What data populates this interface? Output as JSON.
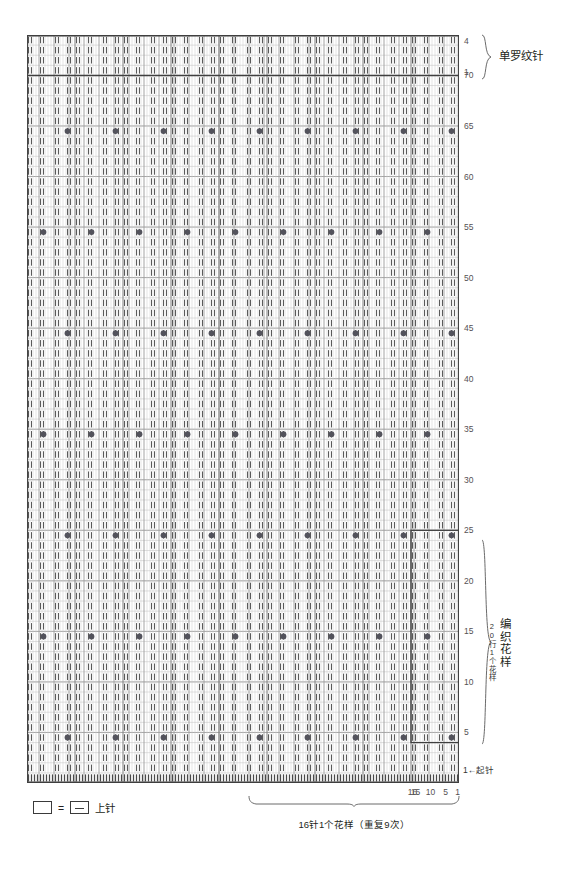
{
  "document": {
    "type": "knitting-stitch-chart",
    "width": 565,
    "height": 873,
    "background": "#ffffff",
    "ink": "#231f20"
  },
  "chart_data": {
    "type": "heatmap",
    "title": "",
    "grid": {
      "columns": 144,
      "rows": 74,
      "cell_width": 3,
      "cell_height": 10.1,
      "stitch_repeat_width": 16,
      "stitch_repeat_count": 9,
      "row_repeat_height": 20
    },
    "axis": {
      "x_label": "16针1个花样（重复9次）",
      "x_ticks": [
        {
          "value": 16,
          "label": "16"
        },
        {
          "value": 15,
          "label": "15"
        },
        {
          "value": 10,
          "label": "10"
        },
        {
          "value": 5,
          "label": "5"
        },
        {
          "value": 1,
          "label": "1"
        }
      ],
      "y_ticks_main": [
        "70",
        "65",
        "60",
        "55",
        "50",
        "45",
        "40",
        "35",
        "30",
        "25",
        "20",
        "15",
        "10",
        "5",
        "1"
      ],
      "y_ticks_top": [
        "4",
        "1"
      ],
      "grid_on": true,
      "legend_position": "bottom-left"
    },
    "sections": [
      {
        "name": "单罗纹针",
        "id": "rib-section",
        "row_from": 1,
        "row_to": 4,
        "note": ""
      },
      {
        "name": "编织花样",
        "id": "pattern-section",
        "row_from": 5,
        "row_to": 25,
        "note": "20行1个花样"
      }
    ],
    "purl_columns_in_repeat": [
      2,
      3,
      6,
      7,
      11,
      12,
      15,
      16
    ],
    "bobble_cells": [
      {
        "row": 5,
        "col_in_repeat": 3
      },
      {
        "row": 15,
        "col_in_repeat": 11
      },
      {
        "row": 25,
        "col_in_repeat": 3
      },
      {
        "row": 35,
        "col_in_repeat": 11
      },
      {
        "row": 45,
        "col_in_repeat": 3
      },
      {
        "row": 55,
        "col_in_repeat": 11
      },
      {
        "row": 65,
        "col_in_repeat": 3
      }
    ]
  },
  "labels": {
    "rib_section_name": "单罗纹针",
    "pattern_section_name": "编织花样",
    "pattern_section_note": "20行1个花样",
    "cast_on_note": "1←起针",
    "repeat_caption": "16针1个花样（重复9次）",
    "top_row_high": "4",
    "top_row_low": "1"
  },
  "row_numbers": [
    {
      "label": "70",
      "row": 70
    },
    {
      "label": "65",
      "row": 65
    },
    {
      "label": "60",
      "row": 60
    },
    {
      "label": "55",
      "row": 55
    },
    {
      "label": "50",
      "row": 50
    },
    {
      "label": "45",
      "row": 45
    },
    {
      "label": "40",
      "row": 40
    },
    {
      "label": "35",
      "row": 35
    },
    {
      "label": "30",
      "row": 30
    },
    {
      "label": "25",
      "row": 25
    },
    {
      "label": "20",
      "row": 20
    },
    {
      "label": "15",
      "row": 15
    },
    {
      "label": "10",
      "row": 10
    },
    {
      "label": "5",
      "row": 5
    }
  ],
  "column_numbers": [
    {
      "label": "16",
      "col": 16
    },
    {
      "label": "15",
      "col": 15
    },
    {
      "label": "10",
      "col": 10
    },
    {
      "label": "5",
      "col": 5
    },
    {
      "label": "1",
      "col": 1
    }
  ],
  "legend": {
    "symbol_blank": "",
    "equals": "=",
    "symbol_dash": "—",
    "text": "上针"
  },
  "colors": {
    "grid_line_light": "#c9c9c9",
    "grid_line_medium": "#8e8e8e",
    "grid_line_heavy": "#3f3f3f",
    "dash_mark": "#5a5a5a",
    "bobble_dot": "#53535c",
    "text": "#231f20",
    "number_text": "#555153"
  }
}
